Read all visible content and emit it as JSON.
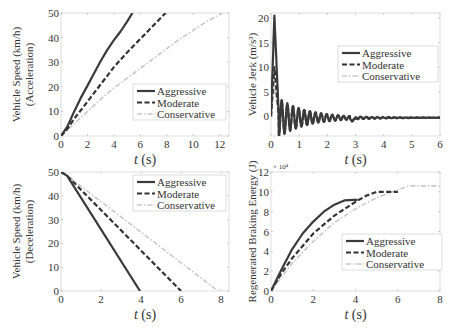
{
  "figure": {
    "legend_entries": [
      "Aggressive",
      "Moderate",
      "Conservative"
    ],
    "series_styles": {
      "Aggressive": {
        "color": "#3a3a3a",
        "dash": "solid"
      },
      "Moderate": {
        "color": "#333333",
        "dash": "dashed"
      },
      "Conservative": {
        "color": "#c8c8c8",
        "dash": "dash-dot"
      }
    }
  },
  "chart_data": [
    {
      "id": "accel-speed",
      "type": "line",
      "title": "",
      "xlabel_italic": "t",
      "xlabel_unit": " (s)",
      "ylabel": [
        "Vehicle Speed (km/h)",
        "(Acceleration)"
      ],
      "xlim": [
        0,
        12.7
      ],
      "ylim": [
        0,
        50
      ],
      "xticks": [
        0,
        2,
        4,
        6,
        8,
        10,
        12
      ],
      "yticks": [
        0,
        10,
        20,
        30,
        40,
        50
      ],
      "legend_position": "center-right",
      "grid": false,
      "series": [
        {
          "name": "Aggressive",
          "x": [
            0,
            0.5,
            1,
            1.5,
            2,
            2.5,
            3,
            3.5,
            4,
            4.5,
            5,
            5.4
          ],
          "y": [
            0,
            4,
            10,
            15.5,
            20.5,
            25.5,
            30.5,
            35,
            39,
            42.5,
            46.5,
            50
          ]
        },
        {
          "name": "Moderate",
          "x": [
            0,
            0.5,
            1,
            2,
            3,
            4,
            5,
            6,
            7,
            7.9
          ],
          "y": [
            0,
            3,
            7,
            14,
            21,
            28,
            34,
            39.5,
            45,
            50
          ]
        },
        {
          "name": "Conservative",
          "x": [
            0,
            1,
            2,
            3,
            4,
            5,
            6,
            7,
            8,
            9,
            10,
            11,
            12.2
          ],
          "y": [
            0,
            5,
            10,
            15,
            19.5,
            23.5,
            27.5,
            31.5,
            35.5,
            39.5,
            43,
            46.5,
            50
          ]
        }
      ]
    },
    {
      "id": "jerk",
      "type": "line",
      "title": "",
      "xlabel_italic": "t",
      "xlabel_unit": " (s)",
      "ylabel": [
        "Vehicle Jerk (m/s³)"
      ],
      "xlim": [
        0,
        6
      ],
      "ylim": [
        -4,
        21
      ],
      "xticks": [
        0,
        1,
        2,
        3,
        4,
        5,
        6
      ],
      "yticks": [
        0,
        5,
        10,
        15,
        20
      ],
      "legend_position": "upper-right",
      "grid": false,
      "series": [
        {
          "name": "Aggressive",
          "peak": 20.5,
          "osc_amp": 4,
          "osc_period": 0.2,
          "decay": 1.0,
          "settle": -0.3
        },
        {
          "name": "Moderate",
          "peak": 10,
          "osc_amp": 3.5,
          "osc_period": 0.2,
          "decay": 0.9,
          "settle": -0.3
        },
        {
          "name": "Conservative",
          "peak": 6,
          "osc_amp": 1.5,
          "osc_period": 0.2,
          "decay": 0.8,
          "settle": -0.1
        }
      ]
    },
    {
      "id": "decel-speed",
      "type": "line",
      "title": "",
      "xlabel_italic": "t",
      "xlabel_unit": " (s)",
      "ylabel": [
        "Vehicle Speed (km/h)",
        "(Deceleration)"
      ],
      "xlim": [
        0,
        8.4
      ],
      "ylim": [
        0,
        50
      ],
      "xticks": [
        0,
        2,
        4,
        6,
        8
      ],
      "yticks": [
        0,
        10,
        20,
        30,
        40,
        50
      ],
      "legend_position": "upper-right",
      "grid": false,
      "series": [
        {
          "name": "Aggressive",
          "x": [
            0,
            0.3,
            3.95
          ],
          "y": [
            50,
            48.5,
            0
          ]
        },
        {
          "name": "Moderate",
          "x": [
            0,
            0.3,
            6.0
          ],
          "y": [
            50,
            48.5,
            0
          ]
        },
        {
          "name": "Conservative",
          "x": [
            0,
            0.3,
            7.85
          ],
          "y": [
            50,
            48.5,
            0
          ]
        }
      ]
    },
    {
      "id": "regen-energy",
      "type": "line",
      "title": "",
      "xlabel_italic": "t",
      "xlabel_unit": " (s)",
      "ylabel": [
        "Regenerated Braking Energy (J)"
      ],
      "y_exponent_label": "× 10⁴",
      "xlim": [
        0,
        8
      ],
      "ylim": [
        0,
        12
      ],
      "xticks": [
        0,
        2,
        4,
        6,
        8
      ],
      "yticks": [
        0,
        2,
        4,
        6,
        8,
        10,
        12
      ],
      "legend_position": "center-right",
      "grid": false,
      "series": [
        {
          "name": "Aggressive",
          "x": [
            0,
            0.5,
            1,
            1.5,
            2,
            2.5,
            3,
            3.5,
            3.9,
            4.1
          ],
          "y": [
            0,
            2.2,
            4.2,
            5.8,
            7.0,
            8.0,
            8.7,
            9.15,
            9.2,
            9.2
          ]
        },
        {
          "name": "Moderate",
          "x": [
            0,
            0.5,
            1,
            2,
            3,
            4,
            4.5,
            5,
            5.5,
            6
          ],
          "y": [
            0,
            1.8,
            3.3,
            5.8,
            7.6,
            9.0,
            9.6,
            10.0,
            10.0,
            10.0
          ]
        },
        {
          "name": "Conservative",
          "x": [
            0,
            1,
            2,
            3,
            4,
            5,
            6,
            6.5,
            7,
            8
          ],
          "y": [
            0,
            2.8,
            5.0,
            6.9,
            8.3,
            9.4,
            10.2,
            10.6,
            10.6,
            10.6
          ]
        }
      ]
    }
  ]
}
